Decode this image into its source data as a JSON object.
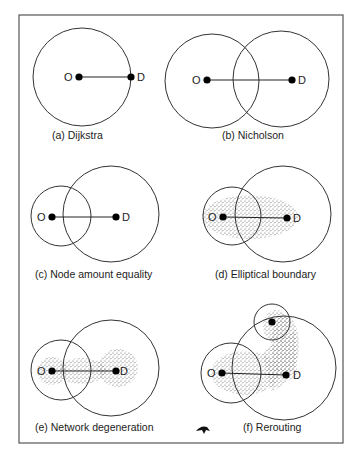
{
  "figure": {
    "panels": [
      {
        "id": "a",
        "caption": "(a) Dijkstra",
        "origin_label": "O",
        "destination_label": "D"
      },
      {
        "id": "b",
        "caption": "(b) Nicholson",
        "origin_label": "O",
        "destination_label": "D"
      },
      {
        "id": "c",
        "caption": "(c) Node amount equality",
        "origin_label": "O",
        "destination_label": "D"
      },
      {
        "id": "d",
        "caption": "(d) Elliptical boundary",
        "origin_label": "O",
        "destination_label": "D"
      },
      {
        "id": "e",
        "caption": "(e) Network degeneration",
        "origin_label": "O",
        "destination_label": "D"
      },
      {
        "id": "f",
        "caption": "(f) Rerouting",
        "origin_label": "O",
        "destination_label": "D"
      }
    ],
    "colors": {
      "stroke": "#333333",
      "node": "#000000",
      "stipple": "#666666",
      "frame": "#555555"
    }
  }
}
